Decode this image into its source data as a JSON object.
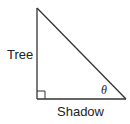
{
  "diagram": {
    "type": "right-triangle",
    "vertical_leg_label": "Tree",
    "horizontal_leg_label": "Shadow",
    "angle_label": "θ",
    "angle_position": "vertex between hypotenuse and shadow",
    "right_angle_marker": true,
    "stroke_color": "#333333"
  }
}
